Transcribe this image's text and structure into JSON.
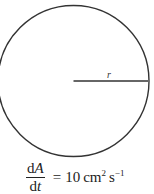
{
  "diagram": {
    "shape": "circle",
    "circle": {
      "cx": 73.5,
      "cy": 81,
      "r": 74,
      "stroke": "#333333",
      "stroke_width": 1.5
    },
    "radius_line": {
      "x1": 73.5,
      "y1": 81,
      "x2": 147.5,
      "y2": 81,
      "stroke": "#333333"
    },
    "radius_label": "r"
  },
  "formula": {
    "numerator_d": "d",
    "numerator_var": "A",
    "denominator_d": "d",
    "denominator_var": "t",
    "equals": "=",
    "value": "10",
    "unit_cm": "cm",
    "unit_cm_power": "2",
    "unit_s": "s",
    "unit_s_power": "−1"
  }
}
